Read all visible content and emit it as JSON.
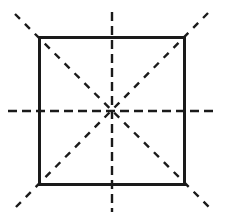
{
  "figure": {
    "description": "A square outlined with a solid dark border, overlaid by four dashed symmetry axes that all pass through the centre: one horizontal, one vertical, and two diagonals through opposite corners. Each dashed axis extends past the square boundary.",
    "canvas": {
      "width": 228,
      "height": 219,
      "background_color": "#ffffff"
    },
    "square": {
      "name": "square-outline",
      "stroke_color": "#1a1a1a",
      "stroke_width": 3,
      "fill": "none",
      "left": 38,
      "top": 36,
      "right": 186,
      "bottom": 186,
      "width": 148,
      "height": 150
    },
    "center": {
      "name": "center-point",
      "x": 112,
      "y": 111
    },
    "axes": [
      {
        "id": "horizontal-axis",
        "label": "horizontal symmetry axis",
        "x1": 8,
        "y1": 111,
        "x2": 216,
        "y2": 111,
        "dash": "9 5",
        "stroke_color": "#1a1a1a",
        "stroke_width": 2.4
      },
      {
        "id": "vertical-axis",
        "label": "vertical symmetry axis",
        "x1": 112,
        "y1": 12,
        "x2": 112,
        "y2": 212,
        "dash": "9 5",
        "stroke_color": "#1a1a1a",
        "stroke_width": 2.4
      },
      {
        "id": "diagonal-axis-nw-se",
        "label": "diagonal symmetry axis top-left to bottom-right",
        "x1": 15,
        "y1": 14,
        "x2": 211,
        "y2": 209,
        "dash": "7 7",
        "stroke_color": "#1a1a1a",
        "stroke_width": 2.4
      },
      {
        "id": "diagonal-axis-ne-sw",
        "label": "diagonal symmetry axis top-right to bottom-left",
        "x1": 208,
        "y1": 13,
        "x2": 13,
        "y2": 210,
        "dash": "7 7",
        "stroke_color": "#1a1a1a",
        "stroke_width": 2.4
      }
    ]
  }
}
